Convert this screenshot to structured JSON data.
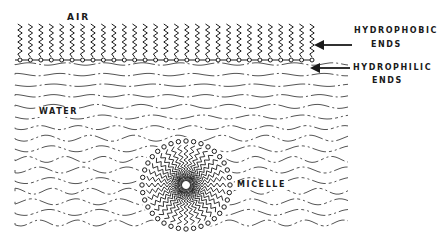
{
  "labels": {
    "air": "AIR",
    "hydrophobic_line1": "HYDROPHOBIC",
    "hydrophobic_line2": "ENDS",
    "hydrophilic_line1": "HYDROPHILIC",
    "hydrophilic_line2": "ENDS",
    "water": "WATER",
    "micelle": "MICELLE"
  },
  "diagram": {
    "ink_color": "#1a1a1a",
    "water_line_color": "#555555",
    "surface_chain_count": 29,
    "micelle_chain_count": 36,
    "water_line_count": 16
  }
}
